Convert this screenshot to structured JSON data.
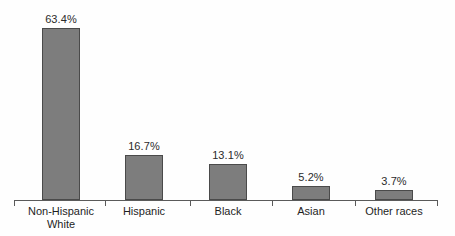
{
  "chart_data": {
    "type": "bar",
    "title": "",
    "subtitle": "",
    "xlabel": "",
    "ylabel": "",
    "categories": [
      "Non-Hispanic White",
      "Hispanic",
      "Black",
      "Asian",
      "Other races"
    ],
    "category_lines": [
      [
        "Non-Hispanic",
        "White"
      ],
      [
        "Hispanic"
      ],
      [
        "Black"
      ],
      [
        "Asian"
      ],
      [
        "Other races"
      ]
    ],
    "values": [
      63.4,
      16.7,
      13.1,
      5.2,
      3.7
    ],
    "value_labels": [
      "63.4%",
      "16.7%",
      "13.1%",
      "5.2%",
      "3.7%"
    ],
    "ylim": [
      0,
      63.4
    ],
    "grid": false,
    "legend": false,
    "axis": {
      "x_axis_visible": true,
      "y_axis_visible": false,
      "tick_marks": true
    },
    "colors": {
      "bar_fill": "#7d7d7d",
      "bar_border": "#4a4a4a",
      "axis": "#5a5a5a",
      "text": "#1f1f1f",
      "background": "#fefefe"
    }
  },
  "layout": {
    "bars": [
      {
        "left": 42,
        "width": 38,
        "height": 172,
        "label_bottom": 175
      },
      {
        "left": 125,
        "width": 38,
        "height": 45,
        "label_bottom": 48
      },
      {
        "left": 209,
        "width": 38,
        "height": 36,
        "label_bottom": 39
      },
      {
        "left": 292,
        "width": 38,
        "height": 14,
        "label_bottom": 17
      },
      {
        "left": 375,
        "width": 38,
        "height": 10,
        "label_bottom": 13
      }
    ],
    "ticks": [
      14,
      105,
      190,
      272,
      355,
      437
    ],
    "label_centers": [
      61,
      144,
      228,
      311,
      394
    ]
  }
}
